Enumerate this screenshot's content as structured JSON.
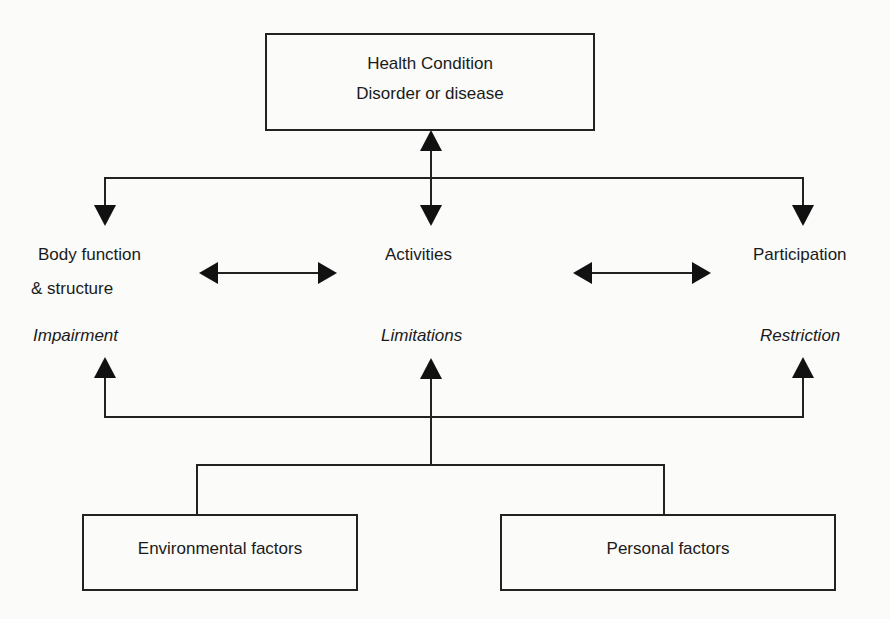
{
  "diagram": {
    "health_condition": {
      "title": "Health Condition",
      "subtitle": "Disorder or disease"
    },
    "components": [
      {
        "name": "Body function",
        "name_line2": "& structure",
        "qualifier": "Impairment"
      },
      {
        "name": "Activities",
        "qualifier": "Limitations"
      },
      {
        "name": "Participation",
        "qualifier": "Restriction"
      }
    ],
    "contextual_factors": [
      {
        "label": "Environmental factors"
      },
      {
        "label": "Personal factors"
      }
    ],
    "colors": {
      "line": "#222222",
      "background": "#fbfbf9"
    }
  }
}
